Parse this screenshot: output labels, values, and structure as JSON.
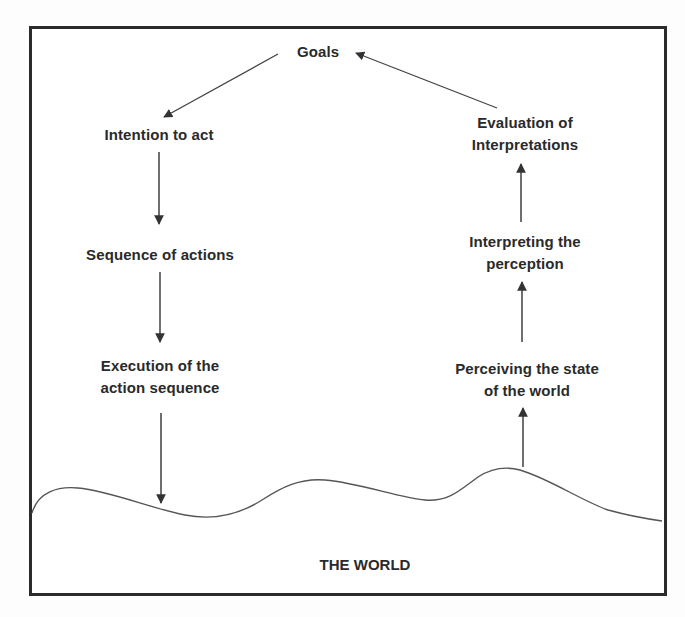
{
  "diagram": {
    "colors": {
      "frame": "#2b2b2b",
      "arrow": "#333333",
      "curve": "#555555",
      "text": "#2a2a2a"
    },
    "nodes": {
      "goals": {
        "label": "Goals"
      },
      "intention": {
        "label": "Intention to act"
      },
      "sequence": {
        "label": "Sequence of actions"
      },
      "execution": {
        "line1": "Execution of the",
        "line2": "action sequence"
      },
      "evaluation": {
        "line1": "Evaluation of",
        "line2": "Interpretations"
      },
      "interpreting": {
        "line1": "Interpreting the",
        "line2": "perception"
      },
      "perceiving": {
        "line1": "Perceiving the state",
        "line2": "of the world"
      },
      "world": {
        "label": "THE WORLD"
      }
    },
    "edges": [
      {
        "from": "goals",
        "to": "intention"
      },
      {
        "from": "intention",
        "to": "sequence"
      },
      {
        "from": "sequence",
        "to": "execution"
      },
      {
        "from": "execution",
        "to": "world"
      },
      {
        "from": "world",
        "to": "perceiving"
      },
      {
        "from": "perceiving",
        "to": "interpreting"
      },
      {
        "from": "interpreting",
        "to": "evaluation"
      },
      {
        "from": "evaluation",
        "to": "goals"
      }
    ]
  }
}
